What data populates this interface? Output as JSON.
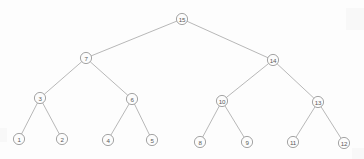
{
  "figure": {
    "name": "binary-tree-diagram",
    "background_color": "#fdfdfd",
    "node_fill_color": "#fcfcfc",
    "node_stroke_color": "#8d8d8d",
    "edge_color": "#9a9a9a",
    "label_color": "#5a5a5a",
    "node_radius": 5.6
  },
  "chart_data": {
    "type": "diagram",
    "title": "",
    "nodes": [
      {
        "id": "n15",
        "label": "15",
        "x": 182,
        "y": 19,
        "level": 1
      },
      {
        "id": "n7",
        "label": "7",
        "x": 86,
        "y": 58,
        "level": 2
      },
      {
        "id": "n14",
        "label": "14",
        "x": 273,
        "y": 60,
        "level": 2
      },
      {
        "id": "n3",
        "label": "3",
        "x": 40,
        "y": 98,
        "level": 3
      },
      {
        "id": "n6",
        "label": "6",
        "x": 132,
        "y": 99,
        "level": 3
      },
      {
        "id": "n10",
        "label": "10",
        "x": 222,
        "y": 101,
        "level": 3
      },
      {
        "id": "n13",
        "label": "13",
        "x": 318,
        "y": 102,
        "level": 3
      },
      {
        "id": "n1",
        "label": "1",
        "x": 19,
        "y": 139,
        "level": 4
      },
      {
        "id": "n2",
        "label": "2",
        "x": 62,
        "y": 139,
        "level": 4
      },
      {
        "id": "n4",
        "label": "4",
        "x": 108,
        "y": 140,
        "level": 4
      },
      {
        "id": "n5",
        "label": "5",
        "x": 152,
        "y": 140,
        "level": 4
      },
      {
        "id": "n8",
        "label": "8",
        "x": 200,
        "y": 142,
        "level": 4
      },
      {
        "id": "n9",
        "label": "9",
        "x": 247,
        "y": 142,
        "level": 4
      },
      {
        "id": "n11",
        "label": "11",
        "x": 293,
        "y": 142,
        "level": 4
      },
      {
        "id": "n12",
        "label": "12",
        "x": 344,
        "y": 143,
        "level": 4
      }
    ],
    "edges": [
      {
        "from": "n15",
        "to": "n7"
      },
      {
        "from": "n15",
        "to": "n14"
      },
      {
        "from": "n7",
        "to": "n3"
      },
      {
        "from": "n7",
        "to": "n6"
      },
      {
        "from": "n14",
        "to": "n10"
      },
      {
        "from": "n14",
        "to": "n13"
      },
      {
        "from": "n3",
        "to": "n1"
      },
      {
        "from": "n3",
        "to": "n2"
      },
      {
        "from": "n6",
        "to": "n4"
      },
      {
        "from": "n6",
        "to": "n5"
      },
      {
        "from": "n10",
        "to": "n8"
      },
      {
        "from": "n10",
        "to": "n9"
      },
      {
        "from": "n13",
        "to": "n11"
      },
      {
        "from": "n13",
        "to": "n12"
      }
    ]
  }
}
